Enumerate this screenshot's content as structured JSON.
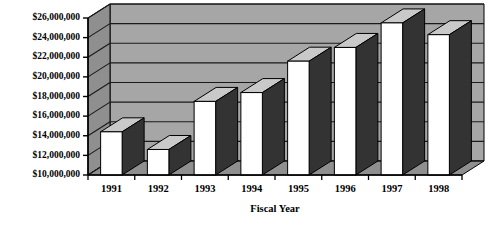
{
  "chart_data": {
    "type": "bar",
    "title": "",
    "subtitle": "",
    "xlabel": "Fiscal Year",
    "ylabel": "",
    "categories": [
      "1991",
      "1992",
      "1993",
      "1994",
      "1995",
      "1996",
      "1997",
      "1998"
    ],
    "values": [
      14400000,
      12600000,
      17500000,
      18400000,
      21600000,
      23000000,
      25500000,
      24300000
    ],
    "ylim": [
      10000000,
      26000000
    ],
    "ytick_values": [
      10000000,
      12000000,
      14000000,
      16000000,
      18000000,
      20000000,
      22000000,
      24000000,
      26000000
    ],
    "ytick_labels": [
      "$10,000,000",
      "$12,000,000",
      "$14,000,000",
      "$16,000,000",
      "$18,000,000",
      "$20,000,000",
      "$22,000,000",
      "$24,000,000",
      "$26,000,000"
    ],
    "grid": true,
    "legend": null,
    "style": "3d-column",
    "colors": {
      "bar_front": "#ffffff",
      "bar_side": "#333333",
      "bar_top": "#c9c9c9",
      "wall_back": "#a6a6a6",
      "wall_side": "#8f8f8f",
      "floor": "#8f8f8f",
      "gridline": "#1a1a1a",
      "axis": "#000000",
      "text": "#000000",
      "background": "#ffffff"
    }
  },
  "labels": {
    "y_axis_title": "",
    "x_axis_title": "Fiscal Year"
  }
}
